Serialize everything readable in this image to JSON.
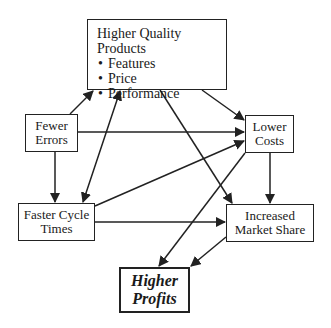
{
  "diagram": {
    "nodes": {
      "higher_quality_products": {
        "title": "Higher Quality Products",
        "bullets": [
          "Features",
          "Price",
          "Performance"
        ]
      },
      "fewer_errors": {
        "line1": "Fewer",
        "line2": "Errors"
      },
      "lower_costs": {
        "line1": "Lower",
        "line2": "Costs"
      },
      "faster_cycle_times": {
        "line1": "Faster Cycle",
        "line2": "Times"
      },
      "increased_market_share": {
        "line1": "Increased",
        "line2": "Market Share"
      },
      "higher_profits": {
        "line1": "Higher",
        "line2": "Profits"
      }
    },
    "edges": [
      {
        "from": "Fewer Errors",
        "to": "Higher Quality Products"
      },
      {
        "from": "Fewer Errors",
        "to": "Lower Costs"
      },
      {
        "from": "Fewer Errors",
        "to": "Faster Cycle Times"
      },
      {
        "from": "Faster Cycle Times",
        "to": "Higher Quality Products",
        "bidirectional": true
      },
      {
        "from": "Faster Cycle Times",
        "to": "Lower Costs"
      },
      {
        "from": "Faster Cycle Times",
        "to": "Increased Market Share"
      },
      {
        "from": "Higher Quality Products",
        "to": "Lower Costs"
      },
      {
        "from": "Higher Quality Products",
        "to": "Increased Market Share"
      },
      {
        "from": "Lower Costs",
        "to": "Increased Market Share"
      },
      {
        "from": "Lower Costs",
        "to": "Higher Profits"
      },
      {
        "from": "Increased Market Share",
        "to": "Higher Profits"
      }
    ],
    "colors": {
      "stroke": "#222222",
      "background": "#ffffff"
    }
  }
}
